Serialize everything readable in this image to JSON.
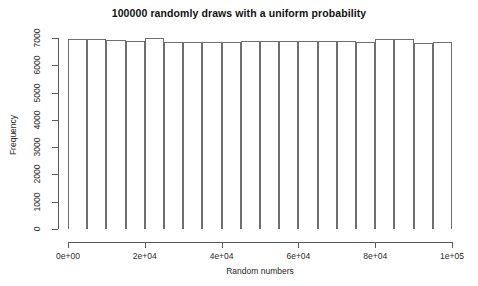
{
  "chart_data": {
    "type": "bar",
    "title": "100000 randomly draws with a uniform probability",
    "xlabel": "Random numbers",
    "ylabel": "Frequency",
    "xlim": [
      0,
      100000
    ],
    "ylim": [
      0,
      7000
    ],
    "grid": false,
    "legend": null,
    "bin_width": 5000,
    "n_bins": 20,
    "x_tick_labels": [
      "0e+00",
      "2e+04",
      "4e+04",
      "6e+04",
      "8e+04",
      "1e+05"
    ],
    "x_tick_values": [
      0,
      20000,
      40000,
      60000,
      80000,
      100000
    ],
    "y_tick_labels": [
      "0",
      "1000",
      "2000",
      "3000",
      "4000",
      "5000",
      "6000",
      "7000"
    ],
    "y_tick_values": [
      0,
      1000,
      2000,
      3000,
      4000,
      5000,
      6000,
      7000
    ],
    "bin_edges": [
      0,
      5000,
      10000,
      15000,
      20000,
      25000,
      30000,
      35000,
      40000,
      45000,
      50000,
      55000,
      60000,
      65000,
      70000,
      75000,
      80000,
      85000,
      90000,
      95000,
      100000
    ],
    "categories": [
      "0-5k",
      "5k-10k",
      "10k-15k",
      "15k-20k",
      "20k-25k",
      "25k-30k",
      "30k-35k",
      "35k-40k",
      "40k-45k",
      "45k-50k",
      "50k-55k",
      "55k-60k",
      "60k-65k",
      "65k-70k",
      "70k-75k",
      "75k-80k",
      "80k-85k",
      "85k-90k",
      "90k-95k",
      "95k-100k"
    ],
    "values": [
      6980,
      6950,
      6910,
      6880,
      7000,
      6850,
      6860,
      6870,
      6850,
      6880,
      6890,
      6880,
      6890,
      6900,
      6890,
      6870,
      6950,
      6960,
      6810,
      6840
    ]
  }
}
